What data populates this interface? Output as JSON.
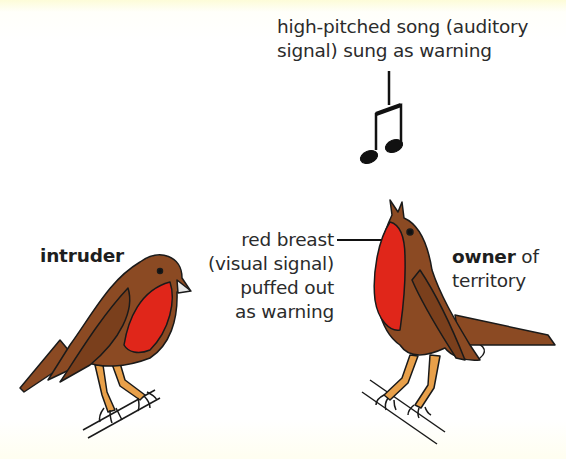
{
  "diagram": {
    "labels": {
      "song_line1": "high-pitched song (auditory",
      "song_line2": "signal) sung as warning",
      "breast_line1": "red breast",
      "breast_line2": "(visual signal)",
      "breast_line3": "puffed out",
      "breast_line4": "as warning",
      "intruder": "intruder",
      "owner_bold": "owner",
      "owner_rest": " of",
      "owner_line2": "territory"
    },
    "icons": {
      "music_note": "beamed-eighth-notes-icon",
      "intruder_bird": "robin-intruder",
      "owner_bird": "robin-owner-singing"
    },
    "colors": {
      "background": "#ffffff",
      "bird_brown": "#8b4a23",
      "breast_red": "#e0261a",
      "legs_orange": "#e8a04a",
      "outline": "#1a1a1a",
      "text": "#2b2b2b"
    }
  }
}
